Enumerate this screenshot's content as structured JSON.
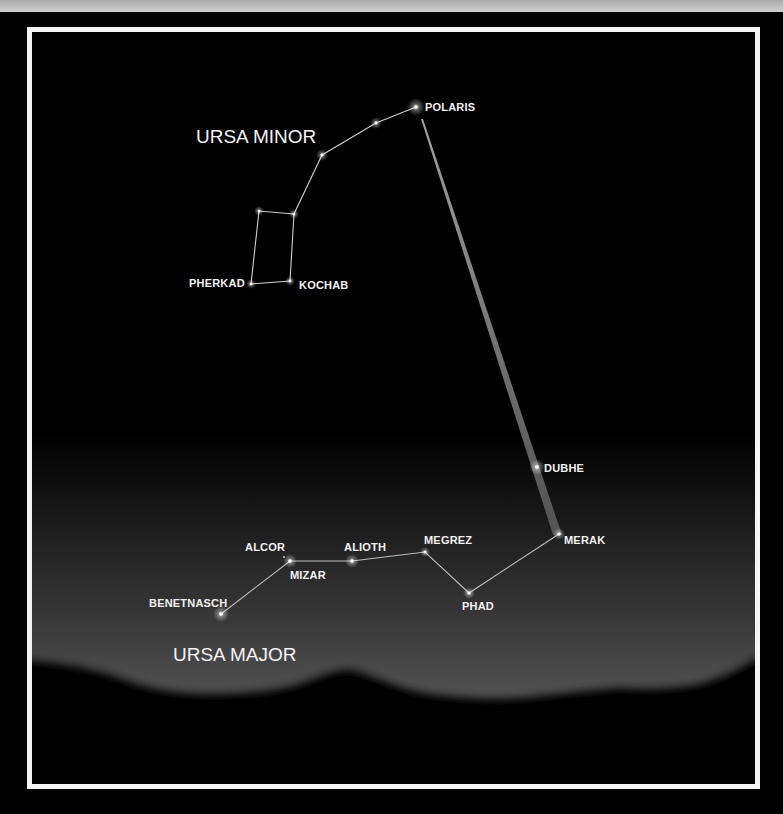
{
  "titles": {
    "ursa_minor": "URSA MINOR",
    "ursa_major": "URSA MAJOR"
  },
  "colors": {
    "background": "#000000",
    "frame": "#f4f4f4",
    "star": "#ffffff",
    "line": "#cfcfcf",
    "pointer": "#5a5a5a",
    "horizon_glow": "#505050"
  },
  "ursa_minor": {
    "stars": [
      {
        "name": "POLARIS",
        "label": "POLARIS"
      },
      {
        "name": "yildun",
        "label": ""
      },
      {
        "name": "epsilon-umi",
        "label": ""
      },
      {
        "name": "zeta-umi",
        "label": ""
      },
      {
        "name": "eta-umi",
        "label": ""
      },
      {
        "name": "KOCHAB",
        "label": "KOCHAB"
      },
      {
        "name": "PHERKAD",
        "label": "PHERKAD"
      }
    ]
  },
  "ursa_major": {
    "stars": [
      {
        "name": "DUBHE",
        "label": "DUBHE"
      },
      {
        "name": "MERAK",
        "label": "MERAK"
      },
      {
        "name": "PHAD",
        "label": "PHAD"
      },
      {
        "name": "MEGREZ",
        "label": "MEGREZ"
      },
      {
        "name": "ALIOTH",
        "label": "ALIOTH"
      },
      {
        "name": "MIZAR",
        "label": "MIZAR"
      },
      {
        "name": "ALCOR",
        "label": "ALCOR"
      },
      {
        "name": "BENETNASCH",
        "label": "BENETNASCH"
      }
    ]
  },
  "pointer": {
    "from": "MERAK",
    "through": "DUBHE",
    "to": "POLARIS"
  }
}
